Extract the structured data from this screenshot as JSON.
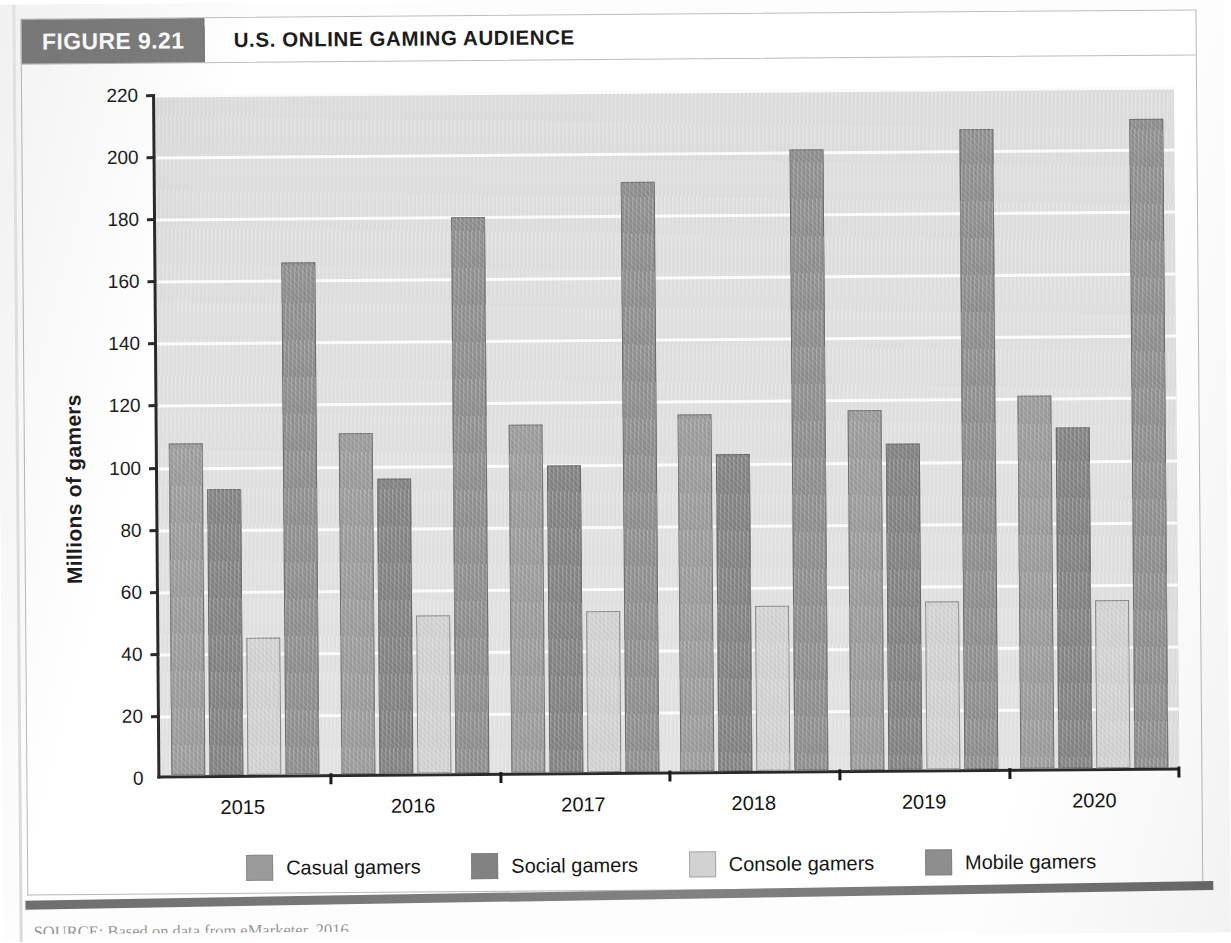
{
  "figure": {
    "badge": "FIGURE 9.21",
    "title": "U.S. ONLINE GAMING AUDIENCE",
    "source": "SOURCE: Based on data from eMarketer, 2016."
  },
  "colors": {
    "casual": "#9b9b9b",
    "social": "#828282",
    "console": "#d2d2d2",
    "mobile": "#8e8e8e",
    "badge_bg": "#7d7d7d",
    "plot_bg": "#dfdfdf",
    "gridline": "#fbfbfb",
    "axis": "#2a2a2a"
  },
  "chart_data": {
    "type": "bar",
    "title": "U.S. ONLINE GAMING AUDIENCE",
    "xlabel": "",
    "ylabel": "Millions of gamers",
    "ylim": [
      0,
      220
    ],
    "ytick_step": 20,
    "yticks": [
      0,
      20,
      40,
      60,
      80,
      100,
      120,
      140,
      160,
      180,
      200,
      220
    ],
    "grid": true,
    "legend_position": "bottom",
    "categories": [
      "2015",
      "2016",
      "2017",
      "2018",
      "2019",
      "2020"
    ],
    "series": [
      {
        "name": "Casual gamers",
        "values": [
          107,
          110,
          112,
          115,
          116,
          120
        ]
      },
      {
        "name": "Social gamers",
        "values": [
          92,
          95,
          99,
          102,
          105,
          110
        ]
      },
      {
        "name": "Console gamers",
        "values": [
          44,
          51,
          52,
          53,
          54,
          54
        ]
      },
      {
        "name": "Mobile gamers",
        "values": [
          165,
          179,
          190,
          200,
          206,
          209
        ]
      }
    ]
  }
}
